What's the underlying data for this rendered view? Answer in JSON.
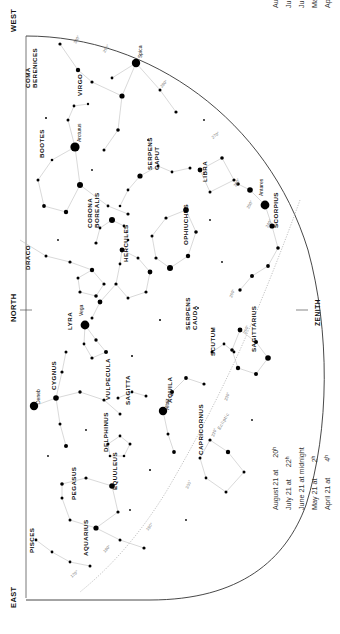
{
  "chart": {
    "kind": "star-chart",
    "cardinals": {
      "west": "WEST",
      "north": "NORTH",
      "east": "EAST",
      "zenith": "ZENITH"
    },
    "ecliptic_label": "Ecliptic",
    "legend_top": [
      "April 6 at   5ʰ",
      "May 6 at   3ʰ",
      "June 6 at   1ʰ",
      "July 6 at 23ʰ",
      "August 6 at 21ʰ"
    ],
    "legend_bottom": [
      "April 21 at        4ʰ",
      "May 21 at        2ʰ",
      "June 21 at midnight",
      "July 21 at      22ʰ",
      "August 21 at      20ʰ"
    ],
    "constellations": [
      {
        "name": "COMA\nBERENICES",
        "x": 30,
        "y": 88,
        "rot": -90
      },
      {
        "name": "VIRGO",
        "x": 82,
        "y": 96,
        "rot": -90
      },
      {
        "name": "BOOTES",
        "x": 44,
        "y": 158,
        "rot": -90
      },
      {
        "name": "CORONA\nBOREALIS",
        "x": 92,
        "y": 228,
        "rot": -90
      },
      {
        "name": "DRACO",
        "x": 30,
        "y": 270,
        "rot": -90
      },
      {
        "name": "SERPENS\nCAPUT",
        "x": 152,
        "y": 170,
        "rot": -90
      },
      {
        "name": "LIBRA",
        "x": 207,
        "y": 182,
        "rot": -90
      },
      {
        "name": "SCORPIUS",
        "x": 278,
        "y": 228,
        "rot": -90
      },
      {
        "name": "OPHIUCHUS",
        "x": 188,
        "y": 245,
        "rot": -90
      },
      {
        "name": "HERCULES",
        "x": 128,
        "y": 262,
        "rot": -90
      },
      {
        "name": "SERPENS\nCAUDA",
        "x": 190,
        "y": 330,
        "rot": -90
      },
      {
        "name": "LYRA",
        "x": 72,
        "y": 330,
        "rot": -90
      },
      {
        "name": "SAGITTARIUS",
        "x": 256,
        "y": 352,
        "rot": -90
      },
      {
        "name": "SCUTUM",
        "x": 215,
        "y": 356,
        "rot": -90
      },
      {
        "name": "CYGNUS",
        "x": 56,
        "y": 390,
        "rot": -90
      },
      {
        "name": "VULPECULA",
        "x": 110,
        "y": 400,
        "rot": -90
      },
      {
        "name": "SAGITTA",
        "x": 130,
        "y": 405,
        "rot": -90
      },
      {
        "name": "AQUILA",
        "x": 172,
        "y": 403,
        "rot": -90
      },
      {
        "name": "DELPHINUS",
        "x": 108,
        "y": 452,
        "rot": -90
      },
      {
        "name": "CAPRICORNUS",
        "x": 203,
        "y": 455,
        "rot": -90
      },
      {
        "name": "EQUULEUS",
        "x": 117,
        "y": 490,
        "rot": -90
      },
      {
        "name": "PEGASUS",
        "x": 76,
        "y": 500,
        "rot": -90
      },
      {
        "name": "AQUARIUS",
        "x": 88,
        "y": 556,
        "rot": -90
      },
      {
        "name": "PISCES",
        "x": 34,
        "y": 553,
        "rot": -90
      }
    ],
    "named_stars": [
      {
        "name": "Spica",
        "x": 136,
        "y": 63,
        "mag": 1.0
      },
      {
        "name": "Arcturus",
        "x": 75,
        "y": 147,
        "mag": 1.0
      },
      {
        "name": "Antares",
        "x": 265,
        "y": 205,
        "mag": 1.0
      },
      {
        "name": "Vega",
        "x": 85,
        "y": 325,
        "mag": 1.0
      },
      {
        "name": "Deneb",
        "x": 34,
        "y": 406,
        "mag": 1.0
      },
      {
        "name": "Altair",
        "x": 163,
        "y": 411,
        "mag": 1.0
      }
    ],
    "degree_marks": [
      {
        "label": "300°",
        "x": 76,
        "y": 44
      },
      {
        "label": "290°",
        "x": 105,
        "y": 53
      },
      {
        "label": "280°",
        "x": 162,
        "y": 88
      },
      {
        "label": "270°",
        "x": 213,
        "y": 139
      },
      {
        "label": "260°",
        "x": 236,
        "y": 187
      },
      {
        "label": "250°",
        "x": 249,
        "y": 209
      },
      {
        "label": "240°",
        "x": 268,
        "y": 228
      },
      {
        "label": "260°",
        "x": 232,
        "y": 298
      },
      {
        "label": "250°",
        "x": 246,
        "y": 334
      },
      {
        "label": "230°",
        "x": 227,
        "y": 401
      },
      {
        "label": "220°",
        "x": 214,
        "y": 437
      },
      {
        "label": "200°",
        "x": 188,
        "y": 489
      },
      {
        "label": "190°",
        "x": 148,
        "y": 531
      },
      {
        "label": "180°",
        "x": 105,
        "y": 553
      },
      {
        "label": "170°",
        "x": 72,
        "y": 578
      }
    ]
  }
}
